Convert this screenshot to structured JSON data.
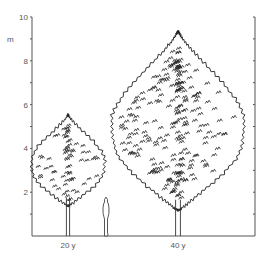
{
  "figure": {
    "unit_label": "m",
    "y_axis": {
      "min": 0,
      "max": 10,
      "tick_step": 1,
      "labeled_ticks": [
        "2",
        "4",
        "6",
        "8",
        "10"
      ],
      "px_top": 17,
      "px_bottom": 236,
      "left_x": 32,
      "right_x": 255
    },
    "trees": [
      {
        "label": "20 y",
        "height_m": 5.5,
        "crown_width_m": 3.3,
        "center_x": 68
      },
      {
        "label": "40 y",
        "height_m": 9.3,
        "crown_width_m": 6.0,
        "center_x": 178
      }
    ],
    "person": {
      "height_m": 1.8,
      "center_x": 106
    },
    "colors": {
      "line": "#222222",
      "axis": "#555555",
      "background": "#ffffff"
    }
  }
}
